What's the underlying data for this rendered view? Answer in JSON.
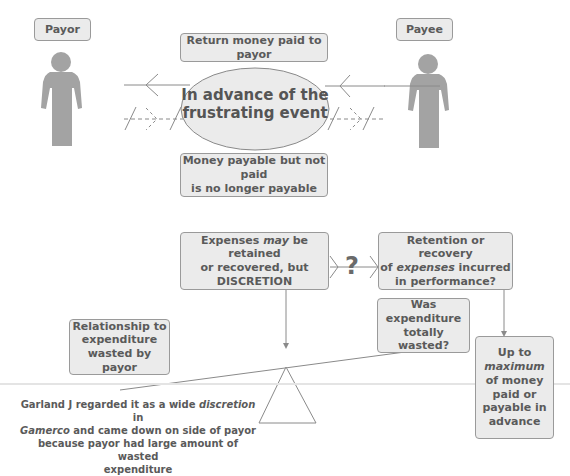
{
  "parties": {
    "payor": {
      "label": "Payor"
    },
    "payee": {
      "label": "Payee"
    }
  },
  "top": {
    "return_box": "Return money paid to payor",
    "event": {
      "line1": "In advance of the",
      "line2": "frustrating event"
    },
    "payable_box": {
      "line1": "Money payable but not paid",
      "line2": "is no longer payable"
    }
  },
  "expenses": {
    "discretion_box": {
      "pre": "Expenses ",
      "em": "may",
      "post": " be retained",
      "line2": "or recovered, but",
      "line3": "DISCRETION"
    },
    "question_mark": "?",
    "retention_box": {
      "line1": "Retention or recovery",
      "pre2": "of ",
      "em2": "expenses",
      "post2": " incurred",
      "line3": "in performance?"
    },
    "wasted_box": {
      "line1": "Was",
      "line2": "expenditure",
      "line3": "totally wasted?"
    },
    "maximum_box": {
      "line1": "Up to",
      "em": "maximum",
      "line3": "of money",
      "line4": "paid or",
      "line5": "payable in",
      "line6": "advance"
    },
    "relationship_box": {
      "line1": "Relationship to",
      "line2": "expenditure",
      "line3": "wasted by payor"
    }
  },
  "caption": {
    "pre1": "Garland J regarded it as a wide ",
    "em1": "discretion",
    "post1": " in",
    "em2": "Gamerco",
    "post2": " and came down on side of payor",
    "line3": "because payor had large amount of wasted",
    "line4": "expenditure"
  },
  "colors": {
    "box_fill": "#ebebeb",
    "border": "#9a9a9a",
    "figure": "#a3a3a3",
    "text": "#5a5a5a"
  }
}
